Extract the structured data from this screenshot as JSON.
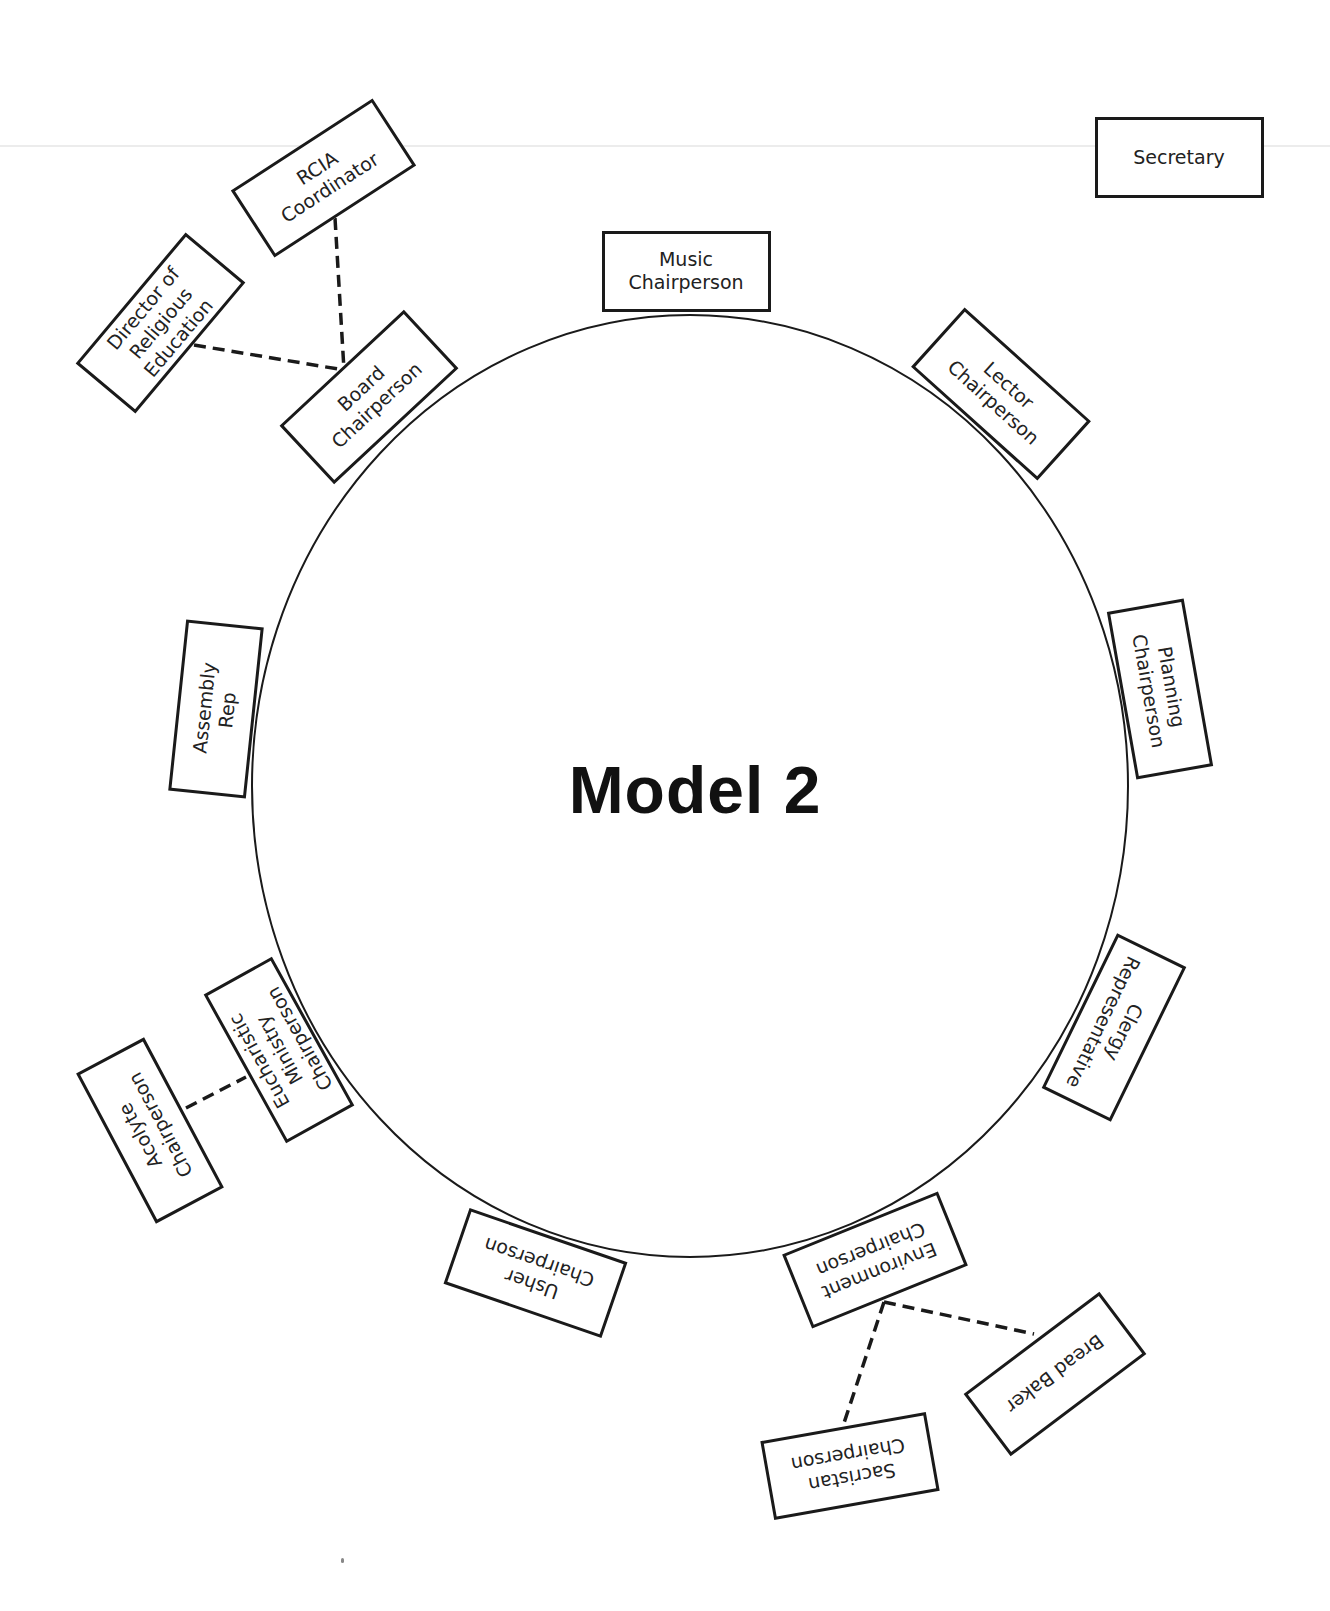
{
  "title": "Model 2",
  "colors": {
    "stroke": "#1a1a1a",
    "background": "#ffffff",
    "text": "#222222"
  },
  "circle": {
    "cx": 690,
    "cy": 786,
    "rx": 438,
    "ry": 471
  },
  "boxes": [
    {
      "id": "secretary",
      "label": "Secretary",
      "cx": 1179,
      "cy": 157,
      "w": 169,
      "h": 81,
      "rot": 0
    },
    {
      "id": "music",
      "label": "Music\nChairperson",
      "cx": 686,
      "cy": 271,
      "w": 169,
      "h": 81,
      "rot": 0
    },
    {
      "id": "rcia",
      "label": "RCIA\nCoordinator",
      "cx": 323,
      "cy": 178,
      "w": 169,
      "h": 80,
      "rot": -33
    },
    {
      "id": "director",
      "label": "Director of\nReligious\nEducation",
      "cx": 160,
      "cy": 323,
      "w": 171,
      "h": 78,
      "rot": -50
    },
    {
      "id": "board",
      "label": "Board\nChairperson",
      "cx": 369,
      "cy": 397,
      "w": 170,
      "h": 80,
      "rot": -43
    },
    {
      "id": "lector",
      "label": "Lector\nChairperson",
      "cx": 1001,
      "cy": 394,
      "w": 170,
      "h": 80,
      "rot": 42
    },
    {
      "id": "planning",
      "label": "Planning\nChairperson",
      "cx": 1160,
      "cy": 689,
      "w": 170,
      "h": 78,
      "rot": 80
    },
    {
      "id": "clergy",
      "label": "Clergy\nRepresentative",
      "cx": 1114,
      "cy": 1027,
      "w": 172,
      "h": 77,
      "rot": 116
    },
    {
      "id": "environment",
      "label": "Environment\nChairperson",
      "cx": 875,
      "cy": 1260,
      "w": 168,
      "h": 80,
      "rot": 158
    },
    {
      "id": "bread-baker",
      "label": "Bread Baker",
      "cx": 1055,
      "cy": 1374,
      "w": 170,
      "h": 78,
      "rot": 143
    },
    {
      "id": "sacristan",
      "label": "Sacristan\nChairperson",
      "cx": 850,
      "cy": 1466,
      "w": 168,
      "h": 80,
      "rot": 170
    },
    {
      "id": "usher",
      "label": "Usher\nChairperson",
      "cx": 535,
      "cy": 1273,
      "w": 167,
      "h": 80,
      "rot": -161
    },
    {
      "id": "eucharistic",
      "label": "Eucharistic\nMinistry\nChairperson",
      "cx": 279,
      "cy": 1050,
      "w": 170,
      "h": 78,
      "rot": -119
    },
    {
      "id": "acolyte",
      "label": "Acolyte\nChairperson",
      "cx": 150,
      "cy": 1130,
      "w": 170,
      "h": 77,
      "rot": -118
    },
    {
      "id": "assembly",
      "label": "Assembly\nRep",
      "cx": 216,
      "cy": 709,
      "w": 172,
      "h": 78,
      "rot": -84
    }
  ],
  "connectors": [
    {
      "from": "rcia",
      "to": "board",
      "x1": 335,
      "y1": 218,
      "x2": 344,
      "y2": 370
    },
    {
      "from": "director",
      "to": "board",
      "x1": 194,
      "y1": 345,
      "x2": 344,
      "y2": 370
    },
    {
      "from": "acolyte",
      "to": "eucharistic",
      "x1": 186,
      "y1": 1108,
      "x2": 246,
      "y2": 1077
    },
    {
      "from": "environment",
      "to": "bread-baker",
      "x1": 884,
      "y1": 1302,
      "x2": 1034,
      "y2": 1334
    },
    {
      "from": "environment",
      "to": "sacristan",
      "x1": 884,
      "y1": 1302,
      "x2": 843,
      "y2": 1426
    }
  ]
}
